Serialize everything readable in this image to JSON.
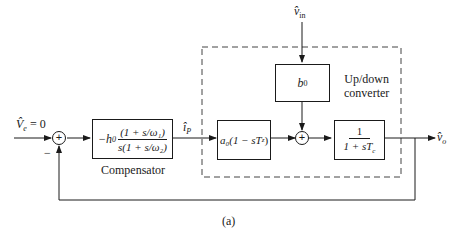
{
  "diagram": {
    "input": {
      "symbol": "V̂",
      "subscript": "e",
      "equals": "= 0"
    },
    "input_sign": "−",
    "summer1_sign": "+",
    "compensator": {
      "prefix": "−h",
      "prefix_sub": "0",
      "numerator": "(1 + s/ω₁)",
      "denominator": "s(1 + s/ω₂)",
      "label": "Compensator"
    },
    "signal_ip": {
      "symbol": "î",
      "subscript": "P"
    },
    "disturbance": {
      "symbol": "v̂",
      "subscript": "in"
    },
    "b_block": {
      "symbol": "b",
      "subscript": "0"
    },
    "a_block": {
      "text": "a₀(1 − sT",
      "sub": "z",
      "close": ")"
    },
    "summer2_sign": "+",
    "lag_block": {
      "numerator": "1",
      "denominator": "1 + sT",
      "den_sub": "c"
    },
    "output": {
      "symbol": "v̂",
      "subscript": "o"
    },
    "converter_label_line1": "Up/down",
    "converter_label_line2": "converter",
    "caption": "(a)"
  }
}
